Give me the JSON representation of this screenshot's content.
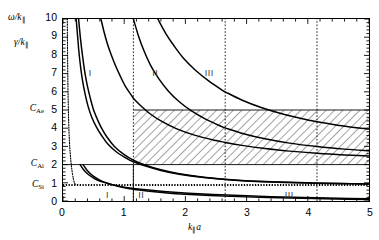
{
  "chart_data": {
    "type": "line",
    "title": "",
    "xlabel": "k∥a",
    "ylabel_primary": "ω/k∥",
    "ylabel_secondary": "γ/k∥",
    "xlim": [
      0,
      5
    ],
    "ylim": [
      0,
      10
    ],
    "grid": false,
    "legend": "none",
    "xticks": [
      0,
      1,
      2,
      3,
      4,
      5
    ],
    "xticklabels": [
      "0",
      "1",
      "2",
      "3",
      "4",
      "5"
    ],
    "yticks": [
      0,
      1,
      2,
      3,
      4,
      5,
      6,
      7,
      8,
      9,
      10
    ],
    "yticklabels": [
      "0",
      "1",
      "2",
      "3",
      "4",
      "5",
      "6",
      "7",
      "8",
      "9",
      "10"
    ],
    "x_minor_tick_step": 0.2,
    "y_minor_tick_step": 0.2,
    "named_y_levels": [
      {
        "name": "C_Ae",
        "label": "C",
        "sub": "Ae",
        "value": 5.0
      },
      {
        "name": "C_Ai",
        "label": "C",
        "sub": "Ai",
        "value": 2.0
      },
      {
        "name": "C_Si",
        "label": "C",
        "sub": "Si",
        "value": 0.88
      }
    ],
    "horizontal_lines": [
      {
        "name": "C_Ae-level",
        "y": 5.0,
        "style": "solid-thin",
        "x_from": 1.15,
        "x_to": 5.0
      },
      {
        "name": "C_Ai-level",
        "y": 2.0,
        "style": "solid-thin",
        "x_from": 0.0,
        "x_to": 5.0
      },
      {
        "name": "C_Si-level",
        "y": 0.88,
        "style": "dotted-thick",
        "x_from": 0.0,
        "x_to": 5.0
      }
    ],
    "vertical_lines": [
      {
        "name": "cutoff-1",
        "x": 1.15,
        "style": "dotted",
        "y_from": 0.0,
        "y_to": 10.0
      },
      {
        "name": "cutoff-2",
        "x": 2.65,
        "style": "dotted",
        "y_from": 0.0,
        "y_to": 10.0
      },
      {
        "name": "cutoff-3",
        "x": 4.15,
        "style": "dotted",
        "y_from": 0.0,
        "y_to": 10.0
      },
      {
        "name": "boundary-solid",
        "x": 1.15,
        "style": "solid-thin",
        "y_from": 0.0,
        "y_to": 2.0
      }
    ],
    "hatched_region": {
      "name": "continuum-band",
      "x_from": 1.15,
      "x_to": 5.0,
      "y_from": 2.0,
      "y_to": 5.0,
      "pattern": "diagonal-hatch-45"
    },
    "region_labels_upper": [
      {
        "text": "I",
        "x": 0.42,
        "y": 7.0
      },
      {
        "text": "II",
        "x": 1.45,
        "y": 7.0
      },
      {
        "text": "III",
        "x": 2.3,
        "y": 7.0
      }
    ],
    "region_labels_lower": [
      {
        "text": "I",
        "x": 0.7,
        "y": 0.38
      },
      {
        "text": "II",
        "x": 1.22,
        "y": 0.38
      },
      {
        "text": "III",
        "x": 3.6,
        "y": 0.38
      }
    ],
    "series": [
      {
        "name": "branch-I-upper",
        "comment": "leftmost steep hyperbolic branch, omega/k",
        "points": [
          [
            0.255,
            10
          ],
          [
            0.28,
            9.1
          ],
          [
            0.3,
            8.5
          ],
          [
            0.33,
            7.7
          ],
          [
            0.36,
            7.0
          ],
          [
            0.4,
            6.3
          ],
          [
            0.45,
            5.6
          ],
          [
            0.5,
            5.0
          ],
          [
            0.56,
            4.5
          ],
          [
            0.63,
            4.0
          ],
          [
            0.72,
            3.5
          ],
          [
            0.84,
            3.0
          ],
          [
            1.0,
            2.55
          ],
          [
            1.15,
            2.25
          ],
          [
            1.35,
            1.97
          ],
          [
            1.6,
            1.72
          ],
          [
            1.9,
            1.5
          ],
          [
            2.3,
            1.31
          ],
          [
            2.8,
            1.16
          ],
          [
            3.4,
            1.06
          ],
          [
            4.1,
            0.99
          ],
          [
            4.6,
            0.96
          ],
          [
            5.0,
            0.94
          ]
        ]
      },
      {
        "name": "branch-I-lower",
        "comment": "second branch just below branch-I-upper, merges at right",
        "points": [
          [
            0.215,
            10
          ],
          [
            0.24,
            9.0
          ],
          [
            0.26,
            8.2
          ],
          [
            0.29,
            7.3
          ],
          [
            0.32,
            6.6
          ],
          [
            0.36,
            5.9
          ],
          [
            0.41,
            5.2
          ],
          [
            0.47,
            4.6
          ],
          [
            0.54,
            4.1
          ],
          [
            0.63,
            3.6
          ],
          [
            0.74,
            3.1
          ],
          [
            0.88,
            2.68
          ],
          [
            1.06,
            2.3
          ],
          [
            1.15,
            2.16
          ],
          [
            1.35,
            1.92
          ],
          [
            1.6,
            1.68
          ],
          [
            1.9,
            1.47
          ],
          [
            2.3,
            1.29
          ],
          [
            2.8,
            1.14
          ],
          [
            3.4,
            1.04
          ],
          [
            4.1,
            0.98
          ],
          [
            4.6,
            0.95
          ],
          [
            5.0,
            0.93
          ]
        ]
      },
      {
        "name": "branch-II-upper",
        "comment": "curve crossing region I/II, reaches top near x=0.62",
        "points": [
          [
            0.62,
            10
          ],
          [
            0.67,
            9.3
          ],
          [
            0.72,
            8.7
          ],
          [
            0.78,
            8.1
          ],
          [
            0.85,
            7.5
          ],
          [
            0.93,
            6.9
          ],
          [
            1.02,
            6.3
          ],
          [
            1.12,
            5.8
          ],
          [
            1.15,
            5.65
          ],
          [
            1.25,
            5.3
          ],
          [
            1.4,
            4.85
          ],
          [
            1.6,
            4.4
          ],
          [
            1.85,
            3.98
          ],
          [
            2.15,
            3.62
          ],
          [
            2.5,
            3.32
          ],
          [
            2.65,
            3.22
          ],
          [
            2.9,
            3.07
          ],
          [
            3.3,
            2.88
          ],
          [
            3.7,
            2.74
          ],
          [
            4.15,
            2.62
          ],
          [
            4.6,
            2.53
          ],
          [
            5.0,
            2.47
          ]
        ]
      },
      {
        "name": "branch-II-lower",
        "comment": "lower companion curve of branch II, asymptote near 2.1",
        "points": [
          [
            1.15,
            10
          ],
          [
            1.24,
            9.0
          ],
          [
            1.33,
            8.2
          ],
          [
            1.44,
            7.4
          ],
          [
            1.57,
            6.7
          ],
          [
            1.72,
            6.05
          ],
          [
            1.9,
            5.45
          ],
          [
            2.1,
            4.95
          ],
          [
            2.33,
            4.5
          ],
          [
            2.6,
            4.08
          ],
          [
            2.65,
            4.02
          ],
          [
            2.95,
            3.7
          ],
          [
            3.3,
            3.42
          ],
          [
            3.7,
            3.18
          ],
          [
            4.15,
            2.99
          ],
          [
            4.6,
            2.85
          ],
          [
            5.0,
            2.76
          ]
        ]
      },
      {
        "name": "branch-III",
        "comment": "rightmost upper curve entering top near x=1.55",
        "points": [
          [
            1.55,
            10
          ],
          [
            1.68,
            9.2
          ],
          [
            1.82,
            8.5
          ],
          [
            1.98,
            7.8
          ],
          [
            2.16,
            7.2
          ],
          [
            2.38,
            6.6
          ],
          [
            2.62,
            6.05
          ],
          [
            2.65,
            6.0
          ],
          [
            2.92,
            5.55
          ],
          [
            3.25,
            5.12
          ],
          [
            3.62,
            4.75
          ],
          [
            4.05,
            4.42
          ],
          [
            4.15,
            4.36
          ],
          [
            4.55,
            4.14
          ],
          [
            5.0,
            3.95
          ]
        ]
      },
      {
        "name": "branch-lower-gamma-1",
        "comment": "lower damping curve below C_Si, upper of the two",
        "points": [
          [
            0.28,
            2.0
          ],
          [
            0.34,
            1.7
          ],
          [
            0.42,
            1.44
          ],
          [
            0.52,
            1.22
          ],
          [
            0.64,
            1.05
          ],
          [
            0.8,
            0.9
          ],
          [
            1.0,
            0.76
          ],
          [
            1.15,
            0.69
          ],
          [
            1.4,
            0.6
          ],
          [
            1.7,
            0.51
          ],
          [
            2.05,
            0.43
          ],
          [
            2.45,
            0.36
          ],
          [
            2.9,
            0.3
          ],
          [
            3.4,
            0.24
          ],
          [
            3.95,
            0.19
          ],
          [
            4.5,
            0.15
          ],
          [
            5.0,
            0.12
          ]
        ]
      },
      {
        "name": "branch-lower-gamma-2",
        "comment": "lower damping curve, slightly below curve 1, crosses near x=1.2",
        "points": [
          [
            0.33,
            2.0
          ],
          [
            0.4,
            1.66
          ],
          [
            0.49,
            1.38
          ],
          [
            0.6,
            1.15
          ],
          [
            0.74,
            0.96
          ],
          [
            0.9,
            0.81
          ],
          [
            1.05,
            0.7
          ],
          [
            1.15,
            0.645
          ],
          [
            1.25,
            0.6
          ],
          [
            1.45,
            0.52
          ],
          [
            1.7,
            0.44
          ],
          [
            2.0,
            0.37
          ],
          [
            2.4,
            0.3
          ],
          [
            2.85,
            0.24
          ],
          [
            3.35,
            0.19
          ],
          [
            3.9,
            0.145
          ],
          [
            4.45,
            0.11
          ],
          [
            5.0,
            0.085
          ]
        ]
      },
      {
        "name": "branch-left-dotted-spike",
        "comment": "near-vertical dotted trace hugging the left axis",
        "points": [
          [
            0.07,
            10
          ],
          [
            0.072,
            9
          ],
          [
            0.075,
            8
          ],
          [
            0.078,
            7
          ],
          [
            0.082,
            6
          ],
          [
            0.088,
            5
          ],
          [
            0.096,
            4
          ],
          [
            0.11,
            3
          ],
          [
            0.135,
            2
          ],
          [
            0.17,
            1.2
          ],
          [
            0.2,
            0.9
          ]
        ]
      }
    ]
  },
  "axes": {
    "y_primary_label": "ω/k",
    "y_primary_sub": "∥",
    "y_secondary_label": "γ/k",
    "y_secondary_sub": "∥",
    "x_label": "k",
    "x_label_sub": "∥",
    "x_label_tail": "a"
  }
}
